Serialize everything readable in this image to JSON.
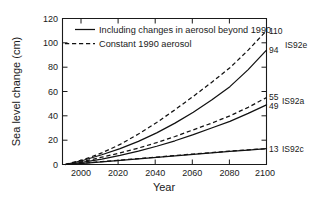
{
  "chart_data": {
    "type": "line",
    "title": "",
    "xlabel": "Year",
    "ylabel": "Sea level change (cm)",
    "xlim": [
      1990,
      2100
    ],
    "ylim": [
      0,
      120
    ],
    "xticks": [
      2000,
      2020,
      2040,
      2060,
      2080,
      2100
    ],
    "yticks": [
      0,
      20,
      40,
      60,
      80,
      100,
      120
    ],
    "grid": false,
    "legend_position": "upper-left-inside",
    "legend": [
      {
        "key": "solid",
        "label": "Including changes in aerosol beyond 1990",
        "style": "solid"
      },
      {
        "key": "dashed",
        "label": "Constant 1990 aerosol",
        "style": "dashed"
      }
    ],
    "x": [
      1990,
      2000,
      2010,
      2020,
      2030,
      2040,
      2050,
      2060,
      2070,
      2080,
      2090,
      2100
    ],
    "series": [
      {
        "name": "IS92e constant 1990 aerosol",
        "scenario": "IS92e",
        "style": "dashed",
        "end_value": 110,
        "values": [
          0,
          4,
          9.5,
          16.5,
          25,
          34.5,
          45,
          56,
          67.5,
          79.5,
          94,
          110
        ]
      },
      {
        "name": "IS92e including aerosol changes",
        "scenario": "IS92e",
        "style": "solid",
        "end_value": 94,
        "values": [
          0,
          3.5,
          8,
          13,
          19,
          26,
          34,
          43,
          53,
          64,
          78,
          94
        ]
      },
      {
        "name": "IS92a constant 1990 aerosol",
        "scenario": "IS92a",
        "style": "dashed",
        "end_value": 55,
        "values": [
          0,
          2.5,
          6,
          9.5,
          13.5,
          18,
          23,
          28.5,
          34,
          40,
          47,
          55
        ]
      },
      {
        "name": "IS92a including aerosol changes",
        "scenario": "IS92a",
        "style": "solid",
        "end_value": 49,
        "values": [
          0,
          2,
          4.5,
          7.5,
          11,
          15,
          19.5,
          24.5,
          30,
          35.5,
          42,
          49
        ]
      },
      {
        "name": "IS92c including aerosol changes",
        "scenario": "IS92c",
        "style": "solid",
        "end_value": 13,
        "values": [
          0,
          1,
          2.2,
          3.4,
          4.6,
          5.8,
          7.1,
          8.4,
          9.6,
          10.8,
          11.9,
          13
        ]
      },
      {
        "name": "IS92c constant 1990 aerosol",
        "scenario": "IS92c",
        "style": "dashed",
        "end_value": 13,
        "values": [
          0,
          1.1,
          2.4,
          3.6,
          4.8,
          6.1,
          7.4,
          8.6,
          9.8,
          11.0,
          12.1,
          13
        ]
      }
    ],
    "end_labels": [
      {
        "value": "110",
        "scenario": "IS92e"
      },
      {
        "value": "94",
        "scenario": ""
      },
      {
        "value": "55",
        "scenario": "IS92a"
      },
      {
        "value": "49",
        "scenario": ""
      },
      {
        "value": "13",
        "scenario": "IS92c"
      }
    ],
    "colors": {
      "line": "#111111",
      "axis": "#1a1a1a",
      "background": "#ffffff"
    }
  }
}
